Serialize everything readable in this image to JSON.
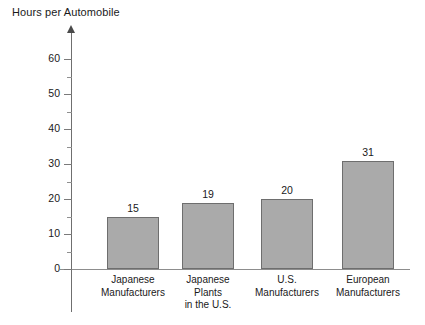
{
  "chart_data": {
    "type": "bar",
    "title": "Hours per Automobile",
    "xlabel": "",
    "ylabel": "Hours per Automobile",
    "categories": [
      "Japanese Manufacturers",
      "Japanese Plants in the U.S.",
      "U.S. Manufacturers",
      "European Manufacturers"
    ],
    "category_lines": [
      [
        "Japanese",
        "Manufacturers"
      ],
      [
        "Japanese",
        "Plants",
        "in the U.S."
      ],
      [
        "U.S.",
        "Manufacturers"
      ],
      [
        "European",
        "Manufacturers"
      ]
    ],
    "values": [
      15,
      19,
      20,
      31
    ],
    "value_labels": [
      "15",
      "19",
      "20",
      "31"
    ],
    "ylim": [
      0,
      65
    ],
    "ytick_labels": [
      "0",
      "10",
      "20",
      "30",
      "40",
      "50",
      "60"
    ],
    "ytick_values": [
      0,
      10,
      20,
      30,
      40,
      50,
      60
    ],
    "yminor_tick_values": [
      5,
      15,
      25,
      35,
      45,
      55
    ],
    "grid": false,
    "legend": null,
    "colors": {
      "bar_fill": "#aaaaaa",
      "bar_border": "#6e6e6e",
      "axis": "#7a7a7a",
      "text": "#1a1a1a",
      "background": "#ffffff"
    }
  }
}
